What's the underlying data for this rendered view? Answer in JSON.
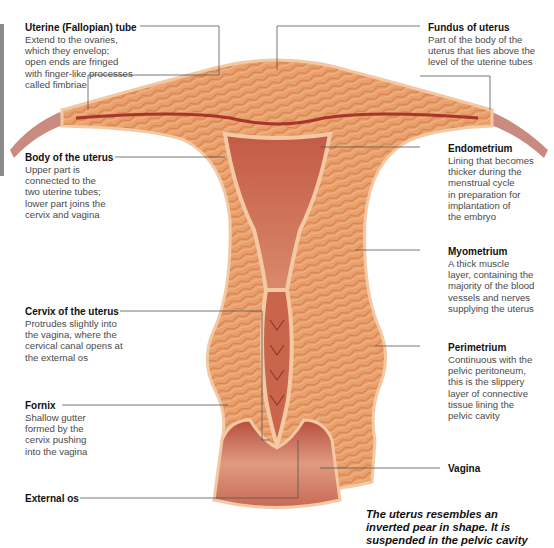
{
  "labels": {
    "uterine_tube": {
      "title": "Uterine (Fallopian) tube",
      "desc": "Extend to the ovaries,\nwhich they envelop;\nopen ends are fringed\nwith finger-like processes\ncalled fimbriae"
    },
    "fundus": {
      "title": "Fundus of uterus",
      "desc": "Part of the body of the\nuterus that lies above the\nlevel of the uterine tubes"
    },
    "body": {
      "title": "Body of the uterus",
      "desc": "Upper part is\nconnected to the\ntwo uterine tubes;\nlower part joins the\ncervix and vagina"
    },
    "endometrium": {
      "title": "Endometrium",
      "desc": "Lining that becomes\nthicker during the\nmenstrual cycle\nin preparation for\nimplantation of\nthe embryo"
    },
    "myometrium": {
      "title": "Myometrium",
      "desc": "A thick muscle\nlayer, containing the\nmajority of the blood\nvessels and nerves\nsupplying the uterus"
    },
    "cervix": {
      "title": "Cervix of the uterus",
      "desc": "Protrudes slightly into\nthe vagina, where the\ncervical canal opens at\nthe external os"
    },
    "perimetrium": {
      "title": "Perimetrium",
      "desc": "Continuous with the\npelvic peritoneum,\nthis is the slippery\nlayer of connective\ntissue lining the\npelvic cavity"
    },
    "fornix": {
      "title": "Fornix",
      "desc": "Shallow gutter\nformed by the\ncervix pushing\ninto the vagina"
    },
    "vagina": {
      "title": "Vagina"
    },
    "external_os": {
      "title": "External os"
    }
  },
  "caption": "The uterus resembles an\ninverted pear in shape. It is\nsuspended in the pelvic cavity",
  "colors": {
    "muscle": "#e8a070",
    "muscle_dark": "#d0784a",
    "lining": "#f3c9a3",
    "cavity": "#c9654a",
    "tube": "#c98a80",
    "leader": "#555555"
  }
}
